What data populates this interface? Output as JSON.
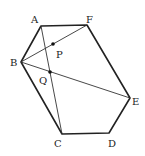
{
  "figure": {
    "type": "hexagon-geometry",
    "vertices": [
      {
        "name": "A",
        "x": 41,
        "y": 26,
        "label_x": 31,
        "label_y": 23
      },
      {
        "name": "F",
        "x": 87,
        "y": 25,
        "label_x": 86,
        "label_y": 23
      },
      {
        "name": "E",
        "x": 130,
        "y": 98,
        "label_x": 132,
        "label_y": 105
      },
      {
        "name": "D",
        "x": 109,
        "y": 133,
        "label_x": 108,
        "label_y": 147
      },
      {
        "name": "C",
        "x": 62,
        "y": 134,
        "label_x": 54,
        "label_y": 147
      },
      {
        "name": "B",
        "x": 21,
        "y": 62,
        "label_x": 10,
        "label_y": 66
      }
    ],
    "points": [
      {
        "name": "P",
        "x": 53,
        "y": 44,
        "label_x": 56,
        "label_y": 58
      },
      {
        "name": "Q",
        "x": 50,
        "y": 72,
        "label_x": 39,
        "label_y": 84
      }
    ],
    "segments": [
      {
        "from": "A",
        "to": "C"
      },
      {
        "from": "B",
        "to": "F"
      },
      {
        "from": "B",
        "to": "E"
      }
    ],
    "labels": {
      "A": "A",
      "B": "B",
      "C": "C",
      "D": "D",
      "E": "E",
      "F": "F",
      "P": "P",
      "Q": "Q"
    }
  }
}
